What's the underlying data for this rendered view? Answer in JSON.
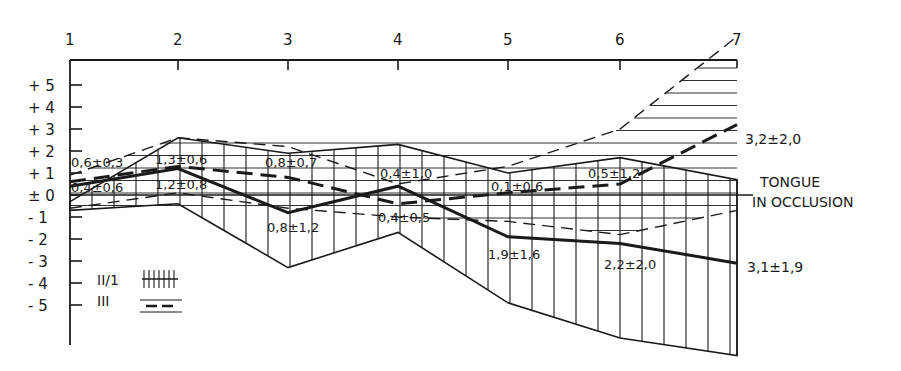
{
  "chart_data": {
    "type": "line",
    "title": "",
    "xlabel": "",
    "ylabel": "",
    "x": [
      1,
      2,
      3,
      4,
      5,
      6,
      7
    ],
    "x_tick_labels": [
      "1",
      "2",
      "3",
      "4",
      "5",
      "6",
      "7"
    ],
    "y_tick_labels": [
      "+ 5",
      "+ 4",
      "+ 3",
      "+ 2",
      "+ 1",
      "± 0",
      "- 1",
      "- 2",
      "- 3",
      "- 4",
      "- 5"
    ],
    "ylim": [
      -6.5,
      6
    ],
    "reference_line": {
      "y": 0,
      "label_line1": "TONGUE",
      "label_line2": "IN OCCLUSION"
    },
    "series": [
      {
        "name": "II/1",
        "style": "solid",
        "pattern": "vertical-hatch",
        "mean": [
          0.4,
          1.2,
          -0.8,
          0.4,
          -1.9,
          -2.2,
          -3.1
        ],
        "upper": [
          -0.3,
          2.6,
          1.9,
          2.3,
          1.0,
          1.7,
          0.7
        ],
        "lower": [
          -0.7,
          -0.4,
          -3.3,
          -1.7,
          -4.9,
          -6.5,
          -7.3
        ],
        "labels": [
          "0,4±0,6",
          "1,2±0,8",
          "0,8±1,2",
          "0,4±1,0",
          "1,9±1,6",
          "2,2±2,0",
          "3,1±1,9"
        ]
      },
      {
        "name": "III",
        "style": "dashed",
        "pattern": "horizontal-hatch",
        "mean": [
          0.6,
          1.3,
          0.8,
          -0.4,
          0.1,
          0.5,
          3.2
        ],
        "upper": [
          0.9,
          2.6,
          2.2,
          0.5,
          1.3,
          3.0,
          7.2
        ],
        "lower": [
          -0.6,
          0.1,
          -0.6,
          -1.0,
          -1.2,
          -1.8,
          -0.7
        ],
        "labels": [
          "0,6±0,3",
          "1,3±0,6",
          "0,8±0,7",
          "0,4±0,5",
          "0,1±0,6",
          "0,5±1,2",
          "3,2±2,0"
        ]
      }
    ],
    "legend": [
      {
        "label": "II/1",
        "swatch": "vertical-hatch-solid"
      },
      {
        "label": "III",
        "swatch": "horizontal-hatch-dashed"
      }
    ],
    "grid": false,
    "legend_position": "lower-left"
  },
  "labels": {
    "x_ticks": [
      "1",
      "2",
      "3",
      "4",
      "5",
      "6",
      "7"
    ],
    "y_ticks": [
      "+ 5",
      "+ 4",
      "+ 3",
      "+ 2",
      "+ 1",
      "± 0",
      "- 1",
      "- 2",
      "- 3",
      "- 4",
      "- 5"
    ],
    "ref_line1": "TONGUE",
    "ref_line2": "IN OCCLUSION",
    "legend_ii": "II/1",
    "legend_iii": "III",
    "ann_ii": [
      "0,4±0,6",
      "1,2±0,8",
      "0,8±1,2",
      "0,4±1,0",
      "1,9±1,6",
      "2,2±2,0",
      "3,1±1,9"
    ],
    "ann_iii": [
      "0,6±0,3",
      "1,3±0,6",
      "0,8±0,7",
      "0,4±0,5",
      "0,1±0,6",
      "0,5±1,2",
      "3,2±2,0"
    ]
  },
  "colors": {
    "ink": "#1a1a1a",
    "background": "#ffffff"
  }
}
